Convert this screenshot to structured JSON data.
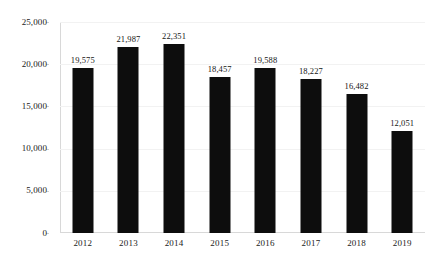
{
  "chart_data": {
    "type": "bar",
    "title": "",
    "subtitle": "",
    "xlabel": "",
    "ylabel": "",
    "categories": [
      "2012",
      "2013",
      "2014",
      "2015",
      "2016",
      "2017",
      "2018",
      "2019"
    ],
    "values": [
      19575,
      21987,
      22351,
      18457,
      19588,
      18227,
      16482,
      12051
    ],
    "data_labels": [
      "19,575",
      "21,987",
      "22,351",
      "18,457",
      "19,588",
      "18,227",
      "16,482",
      "12,051"
    ],
    "ylim": [
      0,
      25000
    ],
    "yticks": [
      0,
      5000,
      10000,
      15000,
      20000,
      25000
    ],
    "ytick_labels": [
      "0",
      "5,000",
      "10,000",
      "15,000",
      "20,000",
      "25,000"
    ],
    "grid": true,
    "legend": null,
    "bar_color": "#0d0d0d",
    "background_color": "#ffffff",
    "gridline_color": "#f2f2f2",
    "axis_color": "#d8d8d8"
  }
}
